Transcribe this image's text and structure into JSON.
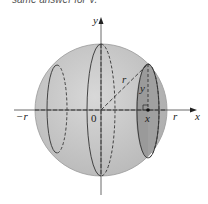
{
  "caption": "same answer for V.",
  "diagram": {
    "type": "sphere-volume-slices",
    "labels": {
      "y_axis": "y",
      "x_axis": "x",
      "origin": "0",
      "neg_r": "−r",
      "pos_r": "r",
      "radius": "r",
      "slice_height": "y",
      "slice_x": "x"
    },
    "colors": {
      "sphere_fill": "#c9c9c9",
      "shaded_slice": "#8f8f8f",
      "lines": "#333333"
    }
  }
}
